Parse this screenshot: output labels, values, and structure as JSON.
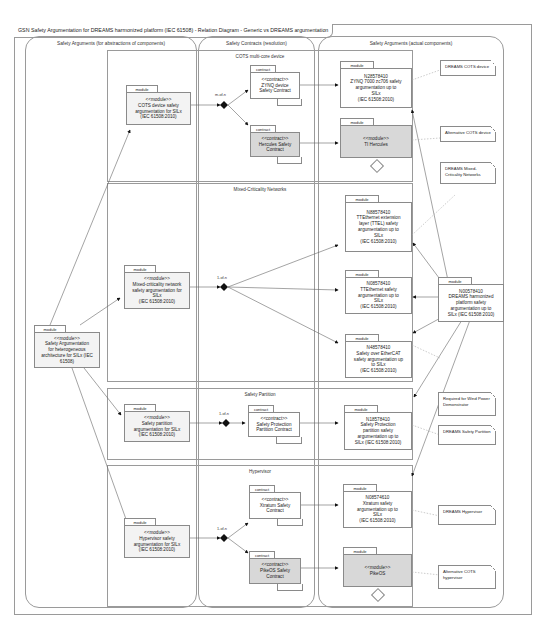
{
  "title": "GSN Safety Argumentation for DREAMS harmonized platform (IEC 61508) - Relation Diagram - Generic vs DREAMS argumentation",
  "lanes": {
    "left": "Safety Arguments (for abstractions of components)",
    "middle": "Safety Contracts (resolution)",
    "right": "Safety Arguments (actual components)"
  },
  "groups": {
    "cots": "COTS multi-core device",
    "mcn": "Mixed-Criticality Networks",
    "partition": "Safety Partition",
    "hypervisor": "Hypervisor"
  },
  "tab_labels": {
    "module": "module",
    "contract": "contract"
  },
  "multiplicity": {
    "cots": "m-of-n",
    "mcn": "1-of-n",
    "partition": "1-of-n",
    "hypervisor": "1-of-n"
  },
  "nodes": {
    "root": [
      "<<module>>",
      "Safety Argumentation",
      "for heterogeneous",
      "architecture for SILx (IEC",
      "61508)"
    ],
    "cots_generic": [
      "<<module>>",
      "COTS device safety",
      "argumentation for SILx",
      "(IEC 61508:2010)"
    ],
    "mcn_generic": [
      "<<module>>",
      "Mixed-criticality network",
      "safety argumentation for",
      "SILx",
      "(IEC 61508:2010)"
    ],
    "partition_generic": [
      "<<module>>",
      "Safety partition",
      "argumentation for SILx",
      "(IEC 61508:2010)"
    ],
    "hyp_generic": [
      "<<module>>",
      "Hypervisor safety",
      "argumentation for SILx",
      "(IEC 61508:2010)"
    ],
    "zynq_contract": [
      "<<contract>>",
      "ZYNQ device",
      "Safety Contract"
    ],
    "hercules_contract": [
      "<<contract>>",
      "Hercules Safety",
      "Contract"
    ],
    "partition_contract": [
      "<<contract>>",
      "Safety Protection",
      "Partition Contract"
    ],
    "xtratum_contract": [
      "<<contract>>",
      "Xtratum Safety",
      "Contract"
    ],
    "pikeos_contract": [
      "<<contract>>",
      "PikeOS Safety",
      "Contract"
    ],
    "zynq_module": [
      "N28578410",
      "ZYNQ 7000 zc706 safety",
      "argumentation up to",
      "SILx",
      "(IEC 61508:2010)"
    ],
    "ti_hercules": [
      "<<module>>",
      "",
      "TI Hercules"
    ],
    "ttel_module": [
      "N88578410",
      "TTEthernet extension",
      "layer (TTEL) safety",
      "argumentation up to",
      "SILx",
      "(IEC 61508:2010)"
    ],
    "tte_module": [
      "N08578410",
      "TTEthernet safety",
      "argumentation up to",
      "SILx",
      "(IEC 61508:2010)"
    ],
    "ethercat_module": [
      "N48578410",
      "Safety over EtherCAT",
      "safety argumentation up",
      "to SILx",
      "(IEC 61508:2010)"
    ],
    "dreams_platform": [
      "N00578410",
      "DREAMS harmonized",
      "platform safety",
      "argumentation up to",
      "SILx (IEC 61508:2010)"
    ],
    "partition_module": [
      "N18578410",
      "Safety Protection",
      "partition safety",
      "argumentation up to",
      "SILx (IEC 61508:2010)"
    ],
    "xtratum_module": [
      "N08574610",
      "Xtratum safety",
      "argumentation up to",
      "SILx",
      "(IEC 61508:2010)"
    ],
    "pikeos_module": [
      "<<module>>",
      "",
      "PikeOS"
    ]
  },
  "notes": {
    "dreams_cots": "DREAMS COTS device",
    "alt_cots": "Alternative COTS device",
    "dreams_mcn": "DREAMS Mixed-Criticality Networks",
    "wind_power": "Required for Wind Power Demonstrator",
    "dreams_partition": "DREAMS Safety Partition",
    "dreams_hypervisor": "DREAMS Hypervisor",
    "alt_hypervisor": "Alternative COTS hypervisor"
  }
}
